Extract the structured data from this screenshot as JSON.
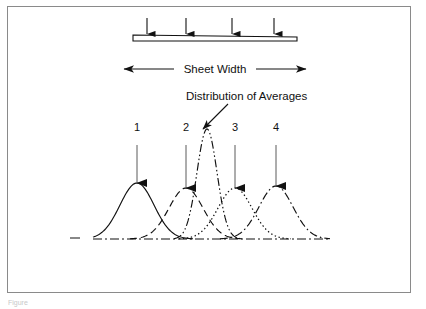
{
  "figure": {
    "background_color": "#ffffff",
    "border_color": "#8a8a8a",
    "ink_color": "#111111",
    "caption_fragment": "Figure"
  },
  "sheet": {
    "width_label": "Sheet Width",
    "bar_left_x": 133,
    "bar_right_x": 297,
    "bar_top_y": 35,
    "bar_left_height": 6,
    "bar_right_height": 4,
    "load_arrow_positions": [
      147,
      186,
      232,
      274
    ],
    "load_arrow_top_y": 18,
    "load_arrow_tip_y": 34,
    "dimension_line_y": 69,
    "dimension_left_x": 124,
    "dimension_right_x": 306
  },
  "annotation": {
    "distribution_label": "Distribution of Averages",
    "label_x": 186,
    "label_y": 100,
    "leader_start_x": 228,
    "leader_start_y": 104,
    "leader_end_x": 203,
    "leader_end_y": 129
  },
  "curves": {
    "baseline_y": 239,
    "baseline_start_x": 93,
    "baseline_end_x": 330,
    "left_tick": {
      "x1": 70,
      "x2": 80,
      "y": 238
    },
    "numbers": [
      {
        "label": "1",
        "x": 137,
        "y": 131
      },
      {
        "label": "2",
        "x": 186,
        "y": 131
      },
      {
        "label": "3",
        "x": 235,
        "y": 131
      },
      {
        "label": "4",
        "x": 276,
        "y": 131
      }
    ],
    "pointer_arrows": [
      {
        "x": 137,
        "top_y": 145,
        "tip_y": 183
      },
      {
        "x": 186,
        "top_y": 145,
        "tip_y": 188
      },
      {
        "x": 235,
        "top_y": 145,
        "tip_y": 188
      },
      {
        "x": 276,
        "top_y": 145,
        "tip_y": 186
      }
    ]
  },
  "chart_data": {
    "type": "line",
    "xlabel": "Sheet Width",
    "ylabel": "",
    "grid": false,
    "legend": "none",
    "xlim": [
      93,
      330
    ],
    "ylim": [
      0,
      1
    ],
    "annotations": [
      {
        "text": "Distribution of Averages",
        "points_to": "averages-curve-peak"
      },
      {
        "text": "Sheet Width",
        "points_to": "sheet-bar-extent"
      }
    ],
    "series": [
      {
        "name": "1",
        "style": "solid",
        "mean": 137,
        "sigma": 17,
        "peak_height": 56,
        "peak_y": 183
      },
      {
        "name": "2",
        "style": "dashed",
        "mean": 186,
        "sigma": 17,
        "peak_height": 51,
        "peak_y": 188
      },
      {
        "name": "Distribution of Averages",
        "style": "dash-dot-dot",
        "mean": 207,
        "sigma": 10,
        "peak_height": 110,
        "peak_y": 129
      },
      {
        "name": "3",
        "style": "dotted",
        "mean": 235,
        "sigma": 17,
        "peak_height": 51,
        "peak_y": 188
      },
      {
        "name": "4",
        "style": "dash-dot",
        "mean": 276,
        "sigma": 17,
        "peak_height": 53,
        "peak_y": 186
      }
    ]
  }
}
